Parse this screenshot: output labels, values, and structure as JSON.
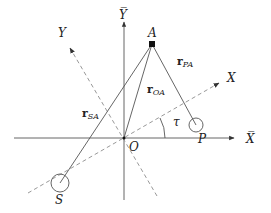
{
  "diagram": {
    "type": "coordinate-frame-vectors",
    "labels": {
      "fixed_x_axis": "X̅",
      "fixed_y_axis": "Y̅",
      "rotated_x_axis": "X",
      "rotated_y_axis": "Y",
      "origin": "O",
      "point_a": "A",
      "point_p": "P",
      "point_s": "S",
      "angle": "τ"
    },
    "vectors": {
      "r_sa": {
        "base": "r",
        "sub": "SA"
      },
      "r_oa": {
        "base": "r",
        "sub": "OA"
      },
      "r_pa": {
        "base": "r",
        "sub": "PA"
      }
    },
    "colors": {
      "line": "#555555",
      "dashed": "#999999",
      "text": "#222222",
      "point": "#111111"
    }
  }
}
